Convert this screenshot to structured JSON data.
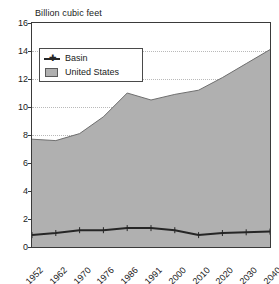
{
  "chart_data": {
    "type": "area",
    "title": "Billion cubic feet",
    "xlabel": "",
    "ylabel": "",
    "categories": [
      "1952",
      "1962",
      "1970",
      "1976",
      "1986",
      "1991",
      "2000",
      "2010",
      "2020",
      "2030",
      "2040"
    ],
    "series": [
      {
        "name": "United States",
        "kind": "area",
        "color": "#b0b0b0",
        "values": [
          7.7,
          7.6,
          8.1,
          9.3,
          11.0,
          10.5,
          10.9,
          11.2,
          12.1,
          13.1,
          14.1
        ]
      },
      {
        "name": "Basin",
        "kind": "line",
        "color": "#262626",
        "values": [
          0.85,
          1.0,
          1.2,
          1.2,
          1.35,
          1.35,
          1.2,
          0.85,
          1.0,
          1.05,
          1.1
        ]
      }
    ],
    "ylim": [
      0,
      16
    ],
    "yticks": [
      0,
      2,
      4,
      6,
      8,
      10,
      12,
      14,
      16
    ],
    "ytick_labels": [
      "0",
      "2",
      "4",
      "6",
      "8",
      "10",
      "12",
      "14",
      "16"
    ],
    "grid": true,
    "grid_axis": "y",
    "legend_position": "top-left-inside",
    "xtick_rotation": -45
  },
  "legend": {
    "entries": [
      {
        "label": "Basin",
        "marker": "line-plus-marker"
      },
      {
        "label": "United States",
        "marker": "filled-swatch"
      }
    ]
  },
  "colors": {
    "area_fill": "#b0b0b0",
    "area_edge": "#6f6f6f",
    "line": "#262626",
    "axis": "#3a3a3a",
    "grid": "#b9b9b9",
    "text": "#1a1a1a",
    "background": "#ffffff"
  }
}
